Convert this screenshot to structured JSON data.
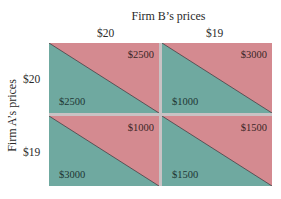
{
  "title": "Firm B’s prices",
  "y_label": "Firm A’s prices",
  "columns": [
    "$20",
    "$19"
  ],
  "rows": [
    "$20",
    "$19"
  ],
  "colors": {
    "firm_b": "#d48a90",
    "firm_a": "#6fa9a0",
    "divider": "#c9c2c4"
  },
  "cells": [
    {
      "row": "$20",
      "col": "$20",
      "firm_a": "$2500",
      "firm_b": "$2500"
    },
    {
      "row": "$20",
      "col": "$19",
      "firm_a": "$1000",
      "firm_b": "$3000"
    },
    {
      "row": "$19",
      "col": "$20",
      "firm_a": "$3000",
      "firm_b": "$1000"
    },
    {
      "row": "$19",
      "col": "$19",
      "firm_a": "$1500",
      "firm_b": "$1500"
    }
  ]
}
